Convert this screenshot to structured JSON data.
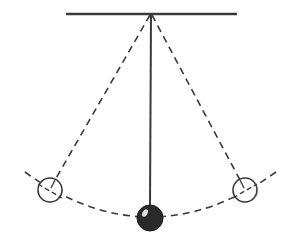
{
  "diagram": {
    "type": "pendulum",
    "colors": {
      "line": "#3a3a3a",
      "bob_fill": "#2a2a2a",
      "open_bob_fill": "#ffffff",
      "highlight": "#dddddd",
      "background": "#ffffff"
    },
    "support_bar": {
      "x1": 66,
      "x2": 237,
      "y": 14
    },
    "pivot": {
      "x": 151,
      "y": 14
    },
    "string_rest": {
      "x1": 151,
      "y1": 14,
      "x2": 150,
      "y2": 205
    },
    "bob_rest": {
      "cx": 150,
      "cy": 218,
      "r": 13,
      "filled": true
    },
    "bob_left": {
      "cx": 50,
      "cy": 190,
      "r": 12,
      "filled": false
    },
    "bob_right": {
      "cx": 245,
      "cy": 190,
      "r": 12,
      "filled": false
    },
    "swing_arc": {
      "start": [
        25,
        172
      ],
      "control": [
        150,
        262
      ],
      "end": [
        276,
        172
      ]
    }
  }
}
